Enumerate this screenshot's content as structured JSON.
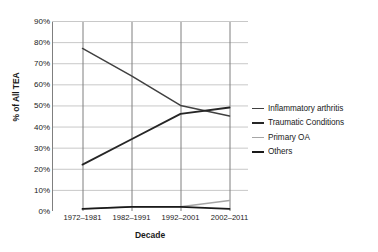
{
  "chart_data": {
    "type": "line",
    "title": "",
    "xlabel": "Decade",
    "ylabel": "% of All TEA",
    "categories": [
      "1972–1981",
      "1982–1991",
      "1992–2001",
      "2002–2011"
    ],
    "ylim": [
      0,
      90
    ],
    "yticks": [
      "0%",
      "10%",
      "20%",
      "30%",
      "40%",
      "50%",
      "60%",
      "70%",
      "80%",
      "90%"
    ],
    "ytick_values": [
      0,
      10,
      20,
      30,
      40,
      50,
      60,
      70,
      80,
      90
    ],
    "grid": true,
    "legend_position": "right",
    "series": [
      {
        "name": "Inflammatory arthritis",
        "values": [
          77,
          64,
          50,
          45
        ],
        "color": "#404040"
      },
      {
        "name": "Traumatic Conditions",
        "values": [
          22,
          34,
          46,
          49
        ],
        "color": "#262626"
      },
      {
        "name": "Primary OA",
        "values": [
          1,
          2,
          2,
          5
        ],
        "color": "#a6a6a6"
      },
      {
        "name": "Others",
        "values": [
          1,
          2,
          2,
          1
        ],
        "color": "#1a1a1a"
      }
    ]
  },
  "axis": {
    "x_title": "Decade",
    "y_title": "% of All TEA"
  },
  "legend": {
    "items": [
      {
        "label": "Inflammatory arthritis",
        "color": "#404040",
        "width": 1.8
      },
      {
        "label": "Traumatic Conditions",
        "color": "#262626",
        "width": 2.4
      },
      {
        "label": "Primary OA",
        "color": "#a6a6a6",
        "width": 1.6
      },
      {
        "label": "Others",
        "color": "#1a1a1a",
        "width": 2.2
      }
    ]
  },
  "colors": {
    "grid": "#c8c8c8",
    "axis": "#7f7f7f",
    "text": "#1a1a1a",
    "background": "#ffffff"
  }
}
